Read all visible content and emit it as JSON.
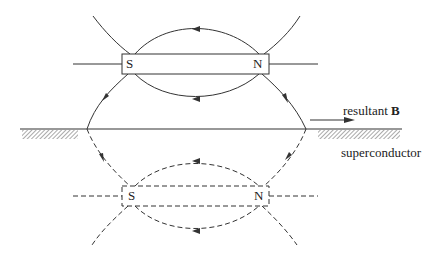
{
  "diagram": {
    "type": "physics-schematic",
    "colors": {
      "line": "#333333",
      "background": "#ffffff"
    },
    "magnet": {
      "south_label": "S",
      "north_label": "N"
    },
    "image_magnet": {
      "south_label": "S",
      "north_label": "N",
      "style": "dashed"
    },
    "resultant": {
      "text": "resultant ",
      "symbol": "B"
    },
    "surface_label": "superconductor"
  }
}
